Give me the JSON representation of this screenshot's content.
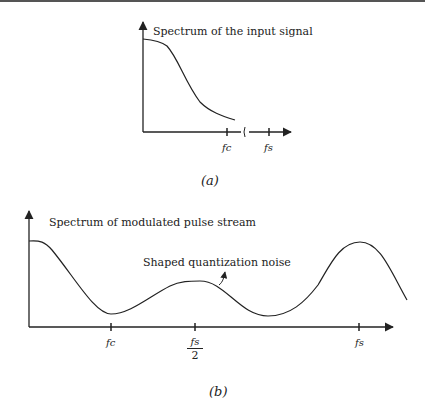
{
  "figure_a": {
    "title": "Spectrum of the input signal",
    "ticks": {
      "fc": "fc",
      "fs": "fs"
    },
    "break_mark": "∫",
    "caption": "(a)"
  },
  "figure_b": {
    "title": "Spectrum of modulated pulse stream",
    "annotation": "Shaped quantization noise",
    "ticks": {
      "fc": "fc",
      "fs_half_num": "fs",
      "fs_half_den": "2",
      "fs": "fs"
    },
    "caption": "(b)"
  },
  "colors": {
    "line": "#222222",
    "background": "#ffffff"
  }
}
